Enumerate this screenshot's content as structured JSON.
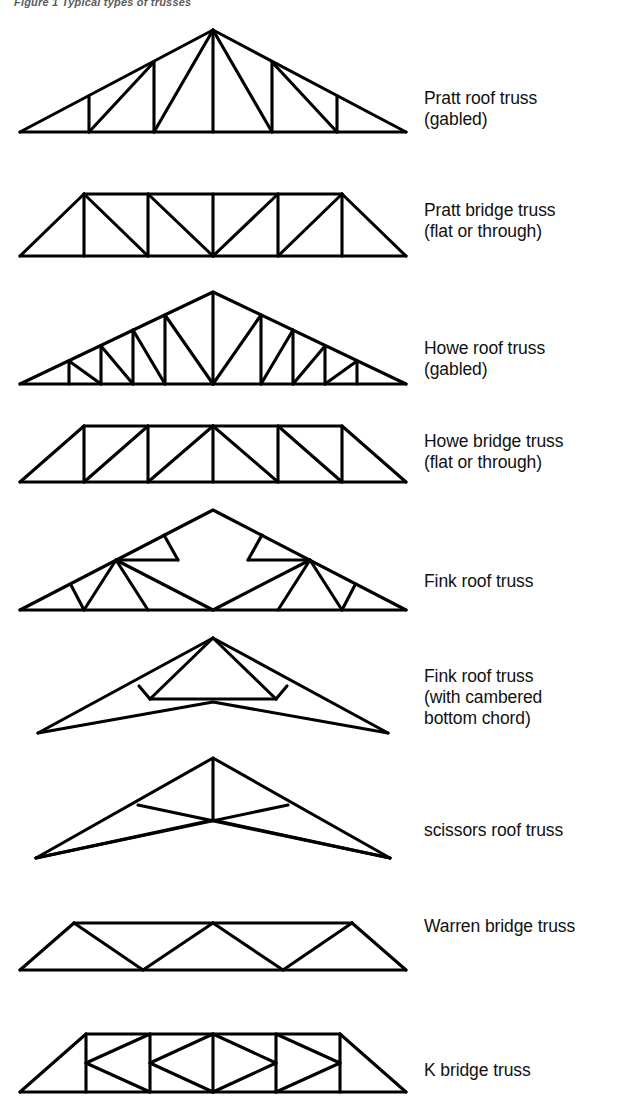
{
  "figure": {
    "caption": "Figure 1  Typical types of trusses"
  },
  "trusses": [
    {
      "id": "pratt-roof-truss",
      "label": "Pratt roof truss\n(gabled)",
      "name": "Pratt roof truss",
      "qualifier": "(gabled)",
      "category": "roof",
      "shape": "gabled",
      "top": 20,
      "height": 120,
      "label_top": 88
    },
    {
      "id": "pratt-bridge-truss",
      "label": "Pratt bridge truss\n(flat or through)",
      "name": "Pratt bridge truss",
      "qualifier": "(flat or through)",
      "category": "bridge",
      "shape": "flat",
      "top": 184,
      "height": 80,
      "label_top": 200
    },
    {
      "id": "howe-roof-truss",
      "label": "Howe roof truss\n(gabled)",
      "name": "Howe roof truss",
      "qualifier": "(gabled)",
      "category": "roof",
      "shape": "gabled",
      "top": 288,
      "height": 105,
      "label_top": 338
    },
    {
      "id": "howe-bridge-truss",
      "label": "Howe bridge truss\n(flat or through)",
      "name": "Howe bridge truss",
      "qualifier": "(flat or through)",
      "category": "bridge",
      "shape": "flat",
      "top": 418,
      "height": 72,
      "label_top": 431
    },
    {
      "id": "fink-roof-truss",
      "label": "Fink roof truss",
      "name": "Fink roof truss",
      "qualifier": "",
      "category": "roof",
      "shape": "gabled",
      "top": 500,
      "height": 120,
      "label_top": 571
    },
    {
      "id": "fink-roof-truss-cambered",
      "label": "Fink roof truss\n(with cambered\nbottom chord)",
      "name": "Fink roof truss",
      "qualifier": "(with cambered bottom chord)",
      "category": "roof",
      "shape": "cambered",
      "top": 630,
      "height": 110,
      "label_top": 666
    },
    {
      "id": "scissors-roof-truss",
      "label": "scissors roof truss",
      "name": "scissors roof truss",
      "qualifier": "",
      "category": "roof",
      "shape": "scissors",
      "top": 750,
      "height": 115,
      "label_top": 820
    },
    {
      "id": "warren-bridge-truss",
      "label": "Warren bridge truss",
      "name": "Warren bridge truss",
      "qualifier": "",
      "category": "bridge",
      "shape": "flat",
      "top": 890,
      "height": 90,
      "label_top": 916
    },
    {
      "id": "k-bridge-truss",
      "label": "K bridge truss",
      "name": "K bridge truss",
      "qualifier": "",
      "category": "bridge",
      "shape": "flat",
      "top": 1012,
      "height": 92,
      "label_top": 1060
    }
  ]
}
